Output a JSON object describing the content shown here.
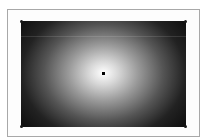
{
  "editor": {
    "tool": "radial-gradient",
    "gradient": {
      "type": "radial",
      "center_color": "#ffffff",
      "edge_color": "#111111",
      "center": {
        "x": 103,
        "y": 73
      }
    },
    "canvas": {
      "x": 21,
      "y": 21,
      "width": 165,
      "height": 106
    },
    "handles": [
      "top-left",
      "top-right",
      "bottom-left",
      "bottom-right"
    ]
  }
}
